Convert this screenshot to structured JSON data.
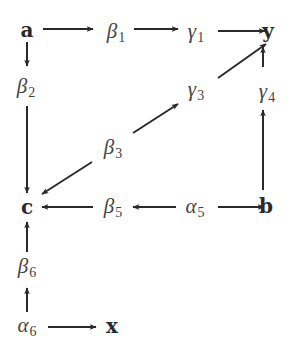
{
  "diagram": {
    "title": "",
    "colors": {
      "line": "#2a2a2a",
      "background": "#ffffff"
    },
    "nodes": [
      {
        "id": "a",
        "symbol": "a",
        "sub": "",
        "style": "bold",
        "x": 27,
        "y": 30
      },
      {
        "id": "b1",
        "symbol": "β",
        "sub": "1",
        "style": "greek",
        "x": 116,
        "y": 33
      },
      {
        "id": "g1",
        "symbol": "γ",
        "sub": "1",
        "style": "greek",
        "x": 196,
        "y": 33
      },
      {
        "id": "y",
        "symbol": "y",
        "sub": "",
        "style": "bold",
        "x": 268,
        "y": 31
      },
      {
        "id": "b2",
        "symbol": "β",
        "sub": "2",
        "style": "greek",
        "x": 26,
        "y": 88
      },
      {
        "id": "g3",
        "symbol": "γ",
        "sub": "3",
        "style": "greek",
        "x": 196,
        "y": 91
      },
      {
        "id": "g4",
        "symbol": "γ",
        "sub": "4",
        "style": "greek",
        "x": 267,
        "y": 93
      },
      {
        "id": "b3",
        "symbol": "β",
        "sub": "3",
        "style": "greek",
        "x": 113,
        "y": 149
      },
      {
        "id": "c",
        "symbol": "c",
        "sub": "",
        "style": "bold",
        "x": 27,
        "y": 207
      },
      {
        "id": "b5",
        "symbol": "β",
        "sub": "5",
        "style": "greek",
        "x": 113,
        "y": 208
      },
      {
        "id": "a5",
        "symbol": "α",
        "sub": "5",
        "style": "greek",
        "x": 195,
        "y": 208
      },
      {
        "id": "b",
        "symbol": "b",
        "sub": "",
        "style": "bold",
        "x": 266,
        "y": 206
      },
      {
        "id": "b6",
        "symbol": "β",
        "sub": "6",
        "style": "greek",
        "x": 27,
        "y": 268
      },
      {
        "id": "a6",
        "symbol": "α",
        "sub": "6",
        "style": "greek",
        "x": 27,
        "y": 327
      },
      {
        "id": "x",
        "symbol": "x",
        "sub": "",
        "style": "bold",
        "x": 112,
        "y": 326
      }
    ],
    "edges": [
      {
        "from": "a",
        "to": "b1",
        "x1": 43,
        "y1": 29,
        "x2": 93,
        "y2": 29
      },
      {
        "from": "b1",
        "to": "g1",
        "x1": 134,
        "y1": 29,
        "x2": 178,
        "y2": 29
      },
      {
        "from": "g1",
        "to": "y",
        "x1": 218,
        "y1": 31,
        "x2": 265,
        "y2": 31
      },
      {
        "from": "a",
        "to": "b2",
        "x1": 27,
        "y1": 42,
        "x2": 27,
        "y2": 66
      },
      {
        "from": "b2",
        "to": "c",
        "x1": 27,
        "y1": 106,
        "x2": 27,
        "y2": 193
      },
      {
        "from": "g3",
        "to": "y",
        "x1": 218,
        "y1": 78,
        "x2": 266,
        "y2": 44
      },
      {
        "from": "g4",
        "to": "y",
        "x1": 263,
        "y1": 67,
        "x2": 263,
        "y2": 47
      },
      {
        "from": "b",
        "to": "g4",
        "x1": 263,
        "y1": 190,
        "x2": 263,
        "y2": 110
      },
      {
        "from": "b3",
        "to": "g3",
        "x1": 133,
        "y1": 133,
        "x2": 178,
        "y2": 104
      },
      {
        "from": "b3",
        "to": "c",
        "x1": 92,
        "y1": 162,
        "x2": 42,
        "y2": 194
      },
      {
        "from": "b5",
        "to": "c",
        "x1": 93,
        "y1": 207,
        "x2": 42,
        "y2": 207
      },
      {
        "from": "a5",
        "to": "b5",
        "x1": 176,
        "y1": 207,
        "x2": 133,
        "y2": 207
      },
      {
        "from": "a5",
        "to": "b",
        "x1": 218,
        "y1": 207,
        "x2": 264,
        "y2": 207
      },
      {
        "from": "b6",
        "to": "c",
        "x1": 27,
        "y1": 252,
        "x2": 27,
        "y2": 222
      },
      {
        "from": "a6",
        "to": "b6",
        "x1": 27,
        "y1": 312,
        "x2": 27,
        "y2": 288
      },
      {
        "from": "a6",
        "to": "x",
        "x1": 48,
        "y1": 327,
        "x2": 96,
        "y2": 327
      }
    ]
  }
}
